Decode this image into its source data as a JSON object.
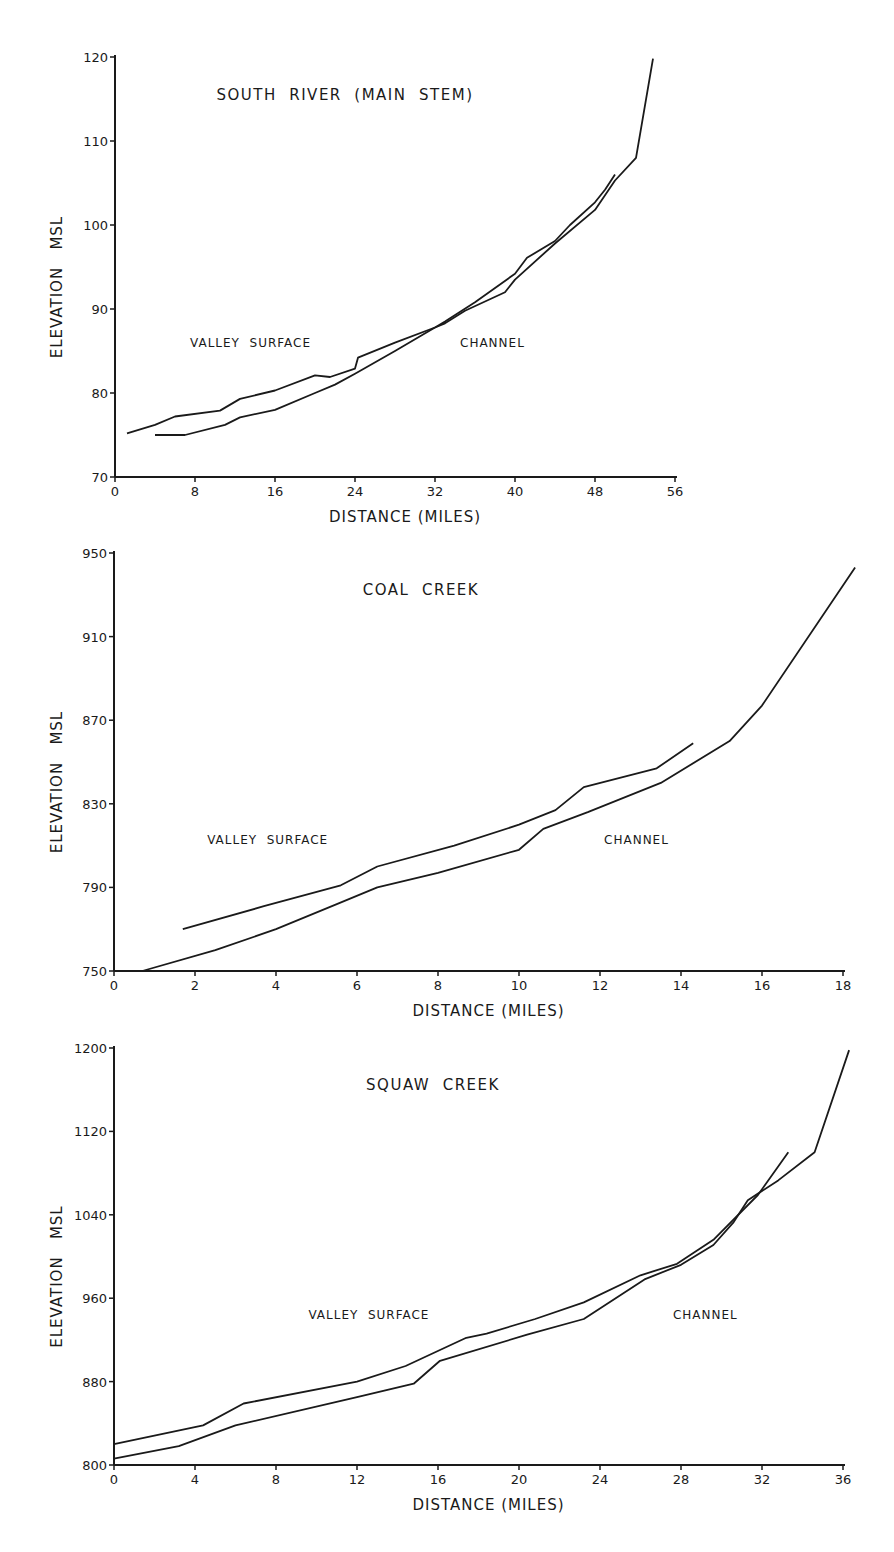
{
  "chart_data": [
    {
      "type": "line",
      "title": "SOUTH RIVER (MAIN STEM)",
      "xlabel": "DISTANCE (MILES)",
      "ylabel": "ELEVATION MSL",
      "xlim": [
        0,
        56
      ],
      "ylim": [
        70,
        120
      ],
      "x_ticks": [
        0,
        8,
        16,
        24,
        32,
        40,
        48,
        56
      ],
      "y_ticks": [
        70,
        80,
        90,
        100,
        110,
        120
      ],
      "grid": false,
      "annotations": [
        {
          "text": "VALLEY SURFACE",
          "x": 7.5,
          "y": 85.5
        },
        {
          "text": "CHANNEL",
          "x": 34.5,
          "y": 85.5
        }
      ],
      "series": [
        {
          "name": "VALLEY SURFACE",
          "points": [
            [
              1.2,
              75.2
            ],
            [
              4,
              76.2
            ],
            [
              6,
              77.2
            ],
            [
              10.5,
              77.9
            ],
            [
              12.5,
              79.3
            ],
            [
              16,
              80.3
            ],
            [
              20,
              82.1
            ],
            [
              21.5,
              81.9
            ],
            [
              24,
              82.9
            ],
            [
              24.3,
              84.2
            ],
            [
              28,
              86
            ],
            [
              32,
              87.8
            ],
            [
              33,
              88.5
            ],
            [
              36,
              90.8
            ],
            [
              40,
              94.2
            ],
            [
              41.2,
              96.1
            ],
            [
              44,
              98.1
            ],
            [
              45.5,
              100
            ],
            [
              48,
              102.7
            ],
            [
              49,
              104.2
            ],
            [
              50,
              106
            ]
          ]
        },
        {
          "name": "CHANNEL",
          "points": [
            [
              4,
              75
            ],
            [
              7,
              75
            ],
            [
              11,
              76.2
            ],
            [
              12.5,
              77.1
            ],
            [
              16,
              78
            ],
            [
              20,
              80
            ],
            [
              22,
              81
            ],
            [
              24,
              82.3
            ],
            [
              28,
              85
            ],
            [
              32,
              87.8
            ],
            [
              33,
              88.3
            ],
            [
              35,
              89.8
            ],
            [
              39,
              92
            ],
            [
              40,
              93.5
            ],
            [
              44,
              97.8
            ],
            [
              48,
              101.8
            ],
            [
              50,
              105.3
            ],
            [
              52.1,
              108
            ],
            [
              53.8,
              119.8
            ]
          ]
        }
      ]
    },
    {
      "type": "line",
      "title": "COAL CREEK",
      "xlabel": "DISTANCE (MILES)",
      "ylabel": "ELEVATION MSL",
      "xlim": [
        0,
        18
      ],
      "ylim": [
        750,
        950
      ],
      "x_ticks": [
        0,
        2,
        4,
        6,
        8,
        10,
        12,
        14,
        16,
        18
      ],
      "y_ticks": [
        750,
        790,
        830,
        870,
        910,
        950
      ],
      "grid": false,
      "annotations": [
        {
          "text": "VALLEY SURFACE",
          "x": 2.3,
          "y": 811
        },
        {
          "text": "CHANNEL",
          "x": 12.1,
          "y": 811
        }
      ],
      "series": [
        {
          "name": "VALLEY SURFACE",
          "points": [
            [
              1.7,
              770
            ],
            [
              3.7,
              781
            ],
            [
              5.6,
              791
            ],
            [
              6.5,
              800
            ],
            [
              8.4,
              810
            ],
            [
              10,
              820
            ],
            [
              10.9,
              827
            ],
            [
              11.6,
              838
            ],
            [
              13.4,
              847
            ],
            [
              14.3,
              859
            ]
          ]
        },
        {
          "name": "CHANNEL",
          "points": [
            [
              0.7,
              750
            ],
            [
              2.5,
              760
            ],
            [
              4,
              770
            ],
            [
              5.5,
              782
            ],
            [
              6.5,
              790
            ],
            [
              8,
              797
            ],
            [
              10,
              808
            ],
            [
              10.6,
              818
            ],
            [
              11.7,
              826
            ],
            [
              13.5,
              840
            ],
            [
              15.2,
              860
            ],
            [
              16,
              877
            ],
            [
              18.3,
              943
            ]
          ]
        }
      ]
    },
    {
      "type": "line",
      "title": "SQUAW CREEK",
      "xlabel": "DISTANCE (MILES)",
      "ylabel": "ELEVATION MSL",
      "xlim": [
        0,
        36
      ],
      "ylim": [
        800,
        1200
      ],
      "x_ticks": [
        0,
        4,
        8,
        12,
        16,
        20,
        24,
        28,
        32,
        36
      ],
      "y_ticks": [
        800,
        880,
        960,
        1040,
        1120,
        1200
      ],
      "grid": false,
      "annotations": [
        {
          "text": "VALLEY SURFACE",
          "x": 9.6,
          "y": 940
        },
        {
          "text": "CHANNEL",
          "x": 27.6,
          "y": 940
        }
      ],
      "series": [
        {
          "name": "VALLEY SURFACE",
          "points": [
            [
              0,
              820
            ],
            [
              4.4,
              838
            ],
            [
              6.4,
              859
            ],
            [
              12,
              880
            ],
            [
              14.4,
              895
            ],
            [
              17.4,
              922
            ],
            [
              18.4,
              926
            ],
            [
              20.8,
              940
            ],
            [
              23.2,
              956
            ],
            [
              26,
              982
            ],
            [
              27.8,
              993
            ],
            [
              29.6,
              1016
            ],
            [
              31.8,
              1059
            ],
            [
              33.3,
              1100
            ]
          ]
        },
        {
          "name": "CHANNEL",
          "points": [
            [
              0,
              806
            ],
            [
              3.2,
              818
            ],
            [
              6,
              838
            ],
            [
              12,
              865
            ],
            [
              14.8,
              878
            ],
            [
              16.1,
              900
            ],
            [
              20.4,
              925
            ],
            [
              23.2,
              940
            ],
            [
              26.2,
              978
            ],
            [
              28,
              992
            ],
            [
              29.6,
              1011
            ],
            [
              30.6,
              1033
            ],
            [
              31.3,
              1054
            ],
            [
              32.8,
              1073
            ],
            [
              34.6,
              1100
            ],
            [
              36.3,
              1198
            ]
          ]
        }
      ]
    }
  ],
  "layout": [
    {
      "x0": 115,
      "y0": 477,
      "x1": 675,
      "y1": 57
    },
    {
      "x0": 114,
      "y0": 971,
      "x1": 843,
      "y1": 553
    },
    {
      "x0": 114,
      "y0": 1465,
      "x1": 843,
      "y1": 1048
    }
  ]
}
